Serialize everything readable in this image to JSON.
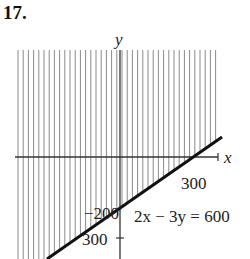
{
  "problem": {
    "number": "17."
  },
  "axes": {
    "x_label": "x",
    "y_label": "y"
  },
  "labels": {
    "x_intercept": "300",
    "y_neg_label": "−200",
    "y_tick_label": "300",
    "equation": "2x − 3y = 600"
  },
  "colors": {
    "hatch": "#8a8a8a",
    "line": "#111111",
    "axis": "#333333"
  },
  "chart_data": {
    "type": "line",
    "title": "2x − 3y = 600",
    "xlabel": "x",
    "ylabel": "y",
    "boundary_line": {
      "equation": "2x - 3y = 600",
      "x_intercept": 300,
      "y_intercept": -200
    },
    "shaded_region": "2x - 3y <= 600 (above the line, vertical hatching)",
    "tick_labels": {
      "x": [
        "300"
      ],
      "y": [
        "−200",
        "300"
      ]
    },
    "grid": false
  }
}
